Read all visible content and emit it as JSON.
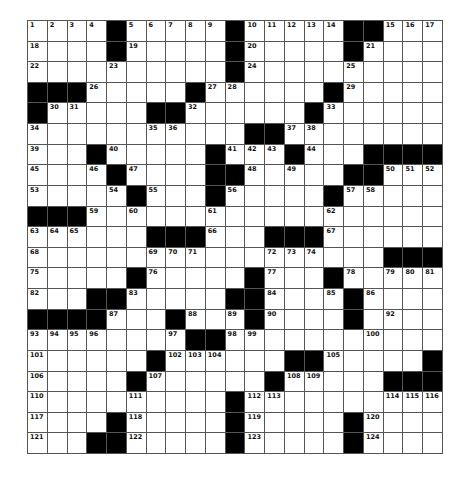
{
  "puzzle": {
    "rows": 21,
    "cols": 21,
    "colors": {
      "block": "#000000",
      "cell": "#ffffff",
      "line": "#555555",
      "number": "#111111"
    },
    "layout": [
      "....#.....#.....##...",
      "....#.....#.....#....",
      "..........#..........",
      "###.....#......#.....",
      "#.....##......#......",
      "...........##........",
      "...#.....#...#...####",
      "....#....##.....##...",
      ".....#...#.....#.....",
      "###..................",
      "......###...###......",
      "..................###",
      ".....#.....#...#.....",
      "...##.....##....#....",
      "####...#...#....#....",
      "........##...........",
      "......#......##.....#",
      ".....#......#.....###",
      "..........#..........",
      "....#.....#.....#....",
      "...##.....#.....#...."
    ],
    "numbers": [
      [
        1,
        2,
        3,
        4,
        0,
        5,
        6,
        7,
        8,
        9,
        0,
        10,
        11,
        12,
        13,
        14,
        0,
        0,
        15,
        16,
        17
      ],
      [
        18,
        0,
        0,
        0,
        0,
        19,
        0,
        0,
        0,
        0,
        0,
        20,
        0,
        0,
        0,
        0,
        0,
        21,
        0,
        0,
        0
      ],
      [
        22,
        0,
        0,
        0,
        23,
        0,
        0,
        0,
        0,
        0,
        0,
        24,
        0,
        0,
        0,
        0,
        25,
        0,
        0,
        0,
        0
      ],
      [
        0,
        0,
        0,
        26,
        0,
        0,
        0,
        0,
        0,
        27,
        28,
        0,
        0,
        0,
        0,
        0,
        29,
        0,
        0,
        0,
        0
      ],
      [
        0,
        30,
        31,
        0,
        0,
        0,
        0,
        0,
        32,
        0,
        0,
        0,
        0,
        0,
        0,
        33,
        0,
        0,
        0,
        0,
        0
      ],
      [
        34,
        0,
        0,
        0,
        0,
        0,
        35,
        36,
        0,
        0,
        0,
        0,
        0,
        37,
        38,
        0,
        0,
        0,
        0,
        0,
        0
      ],
      [
        39,
        0,
        0,
        0,
        40,
        0,
        0,
        0,
        0,
        0,
        41,
        42,
        43,
        0,
        44,
        0,
        0,
        0,
        0,
        0,
        0
      ],
      [
        45,
        0,
        0,
        46,
        0,
        47,
        0,
        0,
        0,
        0,
        0,
        48,
        0,
        49,
        0,
        0,
        0,
        0,
        50,
        51,
        52
      ],
      [
        53,
        0,
        0,
        0,
        54,
        0,
        55,
        0,
        0,
        0,
        56,
        0,
        0,
        0,
        0,
        0,
        57,
        58,
        0,
        0,
        0
      ],
      [
        0,
        0,
        0,
        59,
        0,
        60,
        0,
        0,
        0,
        61,
        0,
        0,
        0,
        0,
        0,
        62,
        0,
        0,
        0,
        0,
        0
      ],
      [
        63,
        64,
        65,
        0,
        0,
        0,
        0,
        0,
        0,
        66,
        0,
        0,
        0,
        0,
        0,
        67,
        0,
        0,
        0,
        0,
        0
      ],
      [
        68,
        0,
        0,
        0,
        0,
        0,
        69,
        70,
        71,
        0,
        0,
        0,
        72,
        73,
        74,
        0,
        0,
        0,
        0,
        0,
        0
      ],
      [
        75,
        0,
        0,
        0,
        0,
        0,
        76,
        0,
        0,
        0,
        0,
        0,
        77,
        0,
        0,
        0,
        78,
        0,
        79,
        80,
        81
      ],
      [
        82,
        0,
        0,
        0,
        0,
        83,
        0,
        0,
        0,
        0,
        0,
        0,
        84,
        0,
        0,
        85,
        0,
        86,
        0,
        0,
        0
      ],
      [
        0,
        0,
        0,
        0,
        87,
        0,
        0,
        0,
        88,
        0,
        89,
        0,
        90,
        0,
        0,
        0,
        91,
        0,
        92,
        0,
        0
      ],
      [
        93,
        94,
        95,
        96,
        0,
        0,
        0,
        97,
        0,
        0,
        98,
        99,
        0,
        0,
        0,
        0,
        0,
        100,
        0,
        0,
        0
      ],
      [
        101,
        0,
        0,
        0,
        0,
        0,
        0,
        102,
        103,
        104,
        0,
        0,
        0,
        0,
        0,
        105,
        0,
        0,
        0,
        0,
        0
      ],
      [
        106,
        0,
        0,
        0,
        0,
        0,
        107,
        0,
        0,
        0,
        0,
        0,
        0,
        108,
        109,
        0,
        0,
        0,
        0,
        0,
        0
      ],
      [
        110,
        0,
        0,
        0,
        0,
        111,
        0,
        0,
        0,
        0,
        0,
        112,
        113,
        0,
        0,
        0,
        0,
        0,
        114,
        115,
        116
      ],
      [
        117,
        0,
        0,
        0,
        0,
        118,
        0,
        0,
        0,
        0,
        0,
        119,
        0,
        0,
        0,
        0,
        0,
        120,
        0,
        0,
        0
      ],
      [
        121,
        0,
        0,
        0,
        0,
        122,
        0,
        0,
        0,
        0,
        0,
        123,
        0,
        0,
        0,
        0,
        0,
        124,
        0,
        0,
        0
      ]
    ]
  }
}
